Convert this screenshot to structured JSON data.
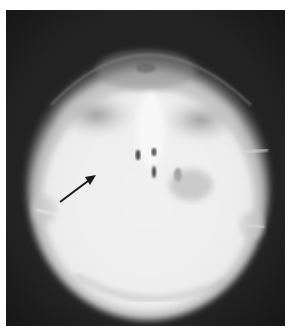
{
  "figure": {
    "background_color": "#232323",
    "bone_color": "#f2f2f2",
    "annotation": {
      "type": "arrow",
      "color": "#1a1a1a",
      "from": [
        60,
        202
      ],
      "to": [
        94,
        176
      ],
      "points_to": "left maxillary region"
    }
  }
}
